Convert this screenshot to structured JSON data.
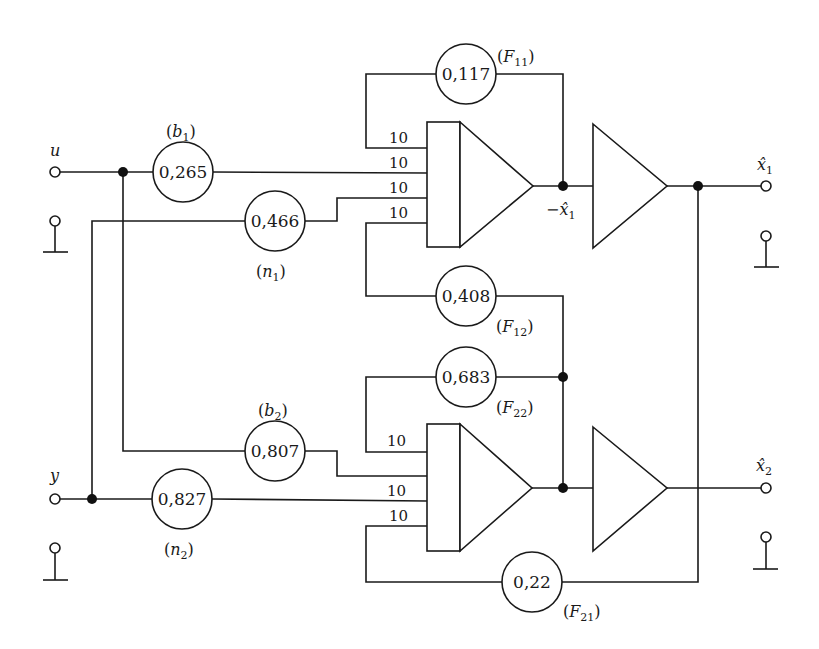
{
  "diagram": {
    "type": "analog-computer-circuit",
    "inputs": [
      {
        "id": "u",
        "label": "u",
        "x": 55,
        "y": 172,
        "ground_y": 221
      },
      {
        "id": "y",
        "label": "y",
        "x": 55,
        "y": 499,
        "ground_y": 548
      }
    ],
    "outputs": [
      {
        "id": "x1hat",
        "label": "x̂",
        "sub": "1",
        "x": 766,
        "y": 186,
        "ground_y": 236
      },
      {
        "id": "x2hat",
        "label": "x̂",
        "sub": "2",
        "x": 766,
        "y": 488,
        "ground_y": 537
      }
    ],
    "coefficients": [
      {
        "id": "b1",
        "value": "0,265",
        "name": "b",
        "sub": "1",
        "cx": 183,
        "cy": 172,
        "label_x": 165,
        "label_y": 137
      },
      {
        "id": "n1",
        "value": "0,466",
        "name": "n",
        "sub": "1",
        "cx": 275,
        "cy": 221,
        "label_x": 256,
        "label_y": 277
      },
      {
        "id": "F11",
        "value": "0,117",
        "name": "F",
        "sub": "11",
        "cx": 466,
        "cy": 74,
        "label_x": 498,
        "label_y": 62
      },
      {
        "id": "F12",
        "value": "0,408",
        "name": "F",
        "sub": "12",
        "cx": 466,
        "cy": 296,
        "label_x": 496,
        "label_y": 332
      },
      {
        "id": "F22",
        "value": "0,683",
        "name": "F",
        "sub": "22",
        "cx": 466,
        "cy": 377,
        "label_x": 496,
        "label_y": 413
      },
      {
        "id": "b2",
        "value": "0,807",
        "name": "b",
        "sub": "2",
        "cx": 275,
        "cy": 451,
        "label_x": 257,
        "label_y": 416
      },
      {
        "id": "n2",
        "value": "0,827",
        "name": "n",
        "sub": "2",
        "cx": 182,
        "cy": 499,
        "label_x": 164,
        "label_y": 555
      },
      {
        "id": "F21",
        "value": "0,22",
        "name": "F",
        "sub": "21",
        "cx": 532,
        "cy": 582,
        "label_x": 564,
        "label_y": 617
      }
    ],
    "integrators": [
      {
        "id": "int1",
        "box": [
          427,
          122,
          460,
          247
        ],
        "tip": [
          533,
          186
        ],
        "gains": [
          "10",
          "10",
          "10",
          "10"
        ],
        "input_ys": [
          148,
          173,
          198,
          223
        ],
        "output_label": "−x̂",
        "output_sub": "1"
      },
      {
        "id": "int2",
        "box": [
          427,
          424,
          460,
          551
        ],
        "tip": [
          532,
          488
        ],
        "gains": [
          "10",
          "10",
          "10"
        ],
        "input_ys": [
          452,
          476,
          501,
          526
        ],
        "gain_ys": [
          452,
          501,
          526
        ]
      }
    ],
    "inverters": [
      {
        "id": "inv1",
        "left": 593,
        "top": 124,
        "bottom": 248,
        "tip": 667,
        "y": 186
      },
      {
        "id": "inv2",
        "left": 593,
        "top": 427,
        "bottom": 551,
        "tip": 667,
        "y": 488
      }
    ],
    "junctions": [
      {
        "x": 123,
        "y": 172
      },
      {
        "x": 92,
        "y": 499
      },
      {
        "x": 563,
        "y": 186
      },
      {
        "x": 698,
        "y": 186
      },
      {
        "x": 563,
        "y": 377
      },
      {
        "x": 563,
        "y": 488
      }
    ],
    "text": {
      "u": "u",
      "y": "y",
      "gain": "10",
      "neg_x1": "−x̂",
      "x_hat": "x̂"
    }
  }
}
